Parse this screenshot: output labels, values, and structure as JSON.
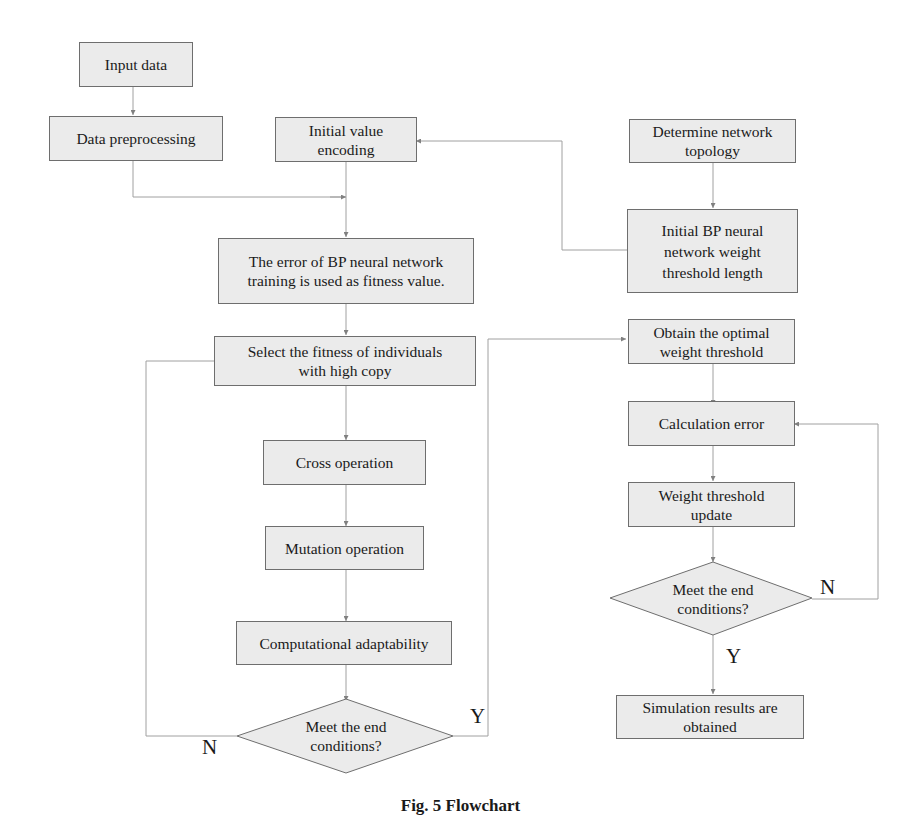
{
  "diagram": {
    "type": "flowchart",
    "left_column": {
      "input": "Input data",
      "preprocess": "Data preprocessing"
    },
    "middle_column": {
      "encode": "Initial value encoding",
      "fitness": "The error of BP neural network training  is used as fitness value.",
      "select": "Select the fitness of individuals with high copy",
      "cross": "Cross operation",
      "mutation": "Mutation operation",
      "adapt": "Computational adaptability",
      "decision": "Meet the end conditions?",
      "decision_no": "N",
      "decision_yes": "Y"
    },
    "right_column": {
      "topology": "Determine network topology",
      "weight_length": "Initial BP neural network weight threshold length",
      "optimal": "Obtain the optimal weight threshold",
      "calc_error": "Calculation error",
      "update": "Weight threshold update",
      "decision": "Meet the end conditions?",
      "decision_no": "N",
      "decision_yes": "Y",
      "result": "Simulation results are obtained"
    },
    "caption": "Fig. 5  Flowchart",
    "colors": {
      "box_fill": "#ebebeb",
      "box_border": "#6e6e6e",
      "arrow": "#808080",
      "line": "#a0a0a0"
    }
  }
}
